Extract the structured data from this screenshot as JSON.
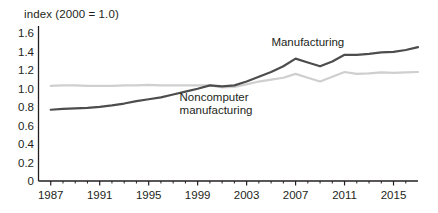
{
  "chart_data": {
    "type": "line",
    "title": "",
    "ylabel": "index (2000 = 1.0)",
    "xlabel": "",
    "ylim": [
      0,
      1.6
    ],
    "xlim": [
      1986,
      2017
    ],
    "grid": false,
    "legend_position": "inline-annotations",
    "ytick_labels": [
      "1.6",
      "1.4",
      "1.2",
      "1.0",
      "0.8",
      "0.6",
      "0.4",
      "0.2",
      "0"
    ],
    "ytick_values": [
      1.6,
      1.4,
      1.2,
      1.0,
      0.8,
      0.6,
      0.4,
      0.2,
      0
    ],
    "xtick_labels": [
      "1987",
      "1991",
      "1995",
      "1999",
      "2003",
      "2007",
      "2011",
      "2015"
    ],
    "xtick_values": [
      1987,
      1991,
      1995,
      1999,
      2003,
      2007,
      2011,
      2015
    ],
    "minor_xticks_every": 1,
    "x": [
      1987,
      1988,
      1989,
      1990,
      1991,
      1992,
      1993,
      1994,
      1995,
      1996,
      1997,
      1998,
      1999,
      2000,
      2001,
      2002,
      2003,
      2004,
      2005,
      2006,
      2007,
      2008,
      2009,
      2010,
      2011,
      2012,
      2013,
      2014,
      2015,
      2016,
      2017
    ],
    "series": [
      {
        "name": "Manufacturing",
        "color": "#4d4d4d",
        "width": 2.2,
        "label_x": 2008,
        "label_y": 1.45,
        "values": [
          0.745,
          0.755,
          0.76,
          0.765,
          0.775,
          0.79,
          0.81,
          0.835,
          0.855,
          0.875,
          0.905,
          0.935,
          0.965,
          1.0,
          0.99,
          1.0,
          1.04,
          1.09,
          1.14,
          1.2,
          1.28,
          1.24,
          1.2,
          1.25,
          1.32,
          1.32,
          1.33,
          1.345,
          1.35,
          1.37,
          1.4
        ]
      },
      {
        "name": "Noncomputer\nmanufacturing",
        "color": "#cfcfcf",
        "width": 2.2,
        "label_x": 2000.5,
        "label_y": 0.88,
        "values": [
          0.995,
          1.0,
          1.0,
          0.995,
          0.995,
          0.995,
          1.0,
          1.0,
          1.005,
          1.0,
          1.0,
          1.0,
          1.0,
          1.0,
          0.98,
          0.985,
          1.01,
          1.04,
          1.06,
          1.08,
          1.12,
          1.08,
          1.04,
          1.09,
          1.14,
          1.12,
          1.125,
          1.135,
          1.13,
          1.135,
          1.14
        ]
      }
    ]
  }
}
